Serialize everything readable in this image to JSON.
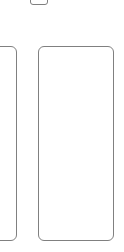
{
  "canvas": {
    "width": 124,
    "height": 252,
    "background_color": "#ffffff",
    "stroke_color": "#808080",
    "stroke_width_px": 1,
    "corner_radius_px": 6
  },
  "shapes": {
    "tab_fragment": {
      "name": "tab-fragment",
      "label": "",
      "x": 30,
      "y": -8,
      "width": 18,
      "height": 13,
      "clipped": "top"
    },
    "left_card": {
      "name": "card-left",
      "label": "",
      "x": -14,
      "y": 46,
      "width": 31,
      "height": 195,
      "clipped": "left"
    },
    "main_card": {
      "name": "card-main",
      "label": "",
      "x": 38,
      "y": 46,
      "width": 76,
      "height": 195,
      "clipped": "none"
    }
  }
}
